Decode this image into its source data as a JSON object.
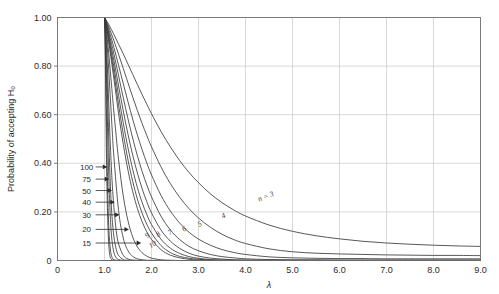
{
  "chart_data": {
    "type": "line",
    "title": "",
    "xlabel": "λ",
    "ylabel": "Probability of accepting H₀",
    "xlim": [
      0,
      9.0
    ],
    "ylim": [
      0,
      1.0
    ],
    "grid": true,
    "legend_position": "inline-curve-labels",
    "xticks": [
      "0",
      "1.0",
      "2.0",
      "3.0",
      "4.0",
      "5.0",
      "6.0",
      "7.0",
      "8.0",
      "9.0"
    ],
    "xtick_values": [
      0,
      1,
      2,
      3,
      4,
      5,
      6,
      7,
      8,
      9
    ],
    "yticks": [
      "0",
      "0.20",
      "0.40",
      "0.60",
      "0.80",
      "1.00"
    ],
    "ytick_values": [
      0,
      0.2,
      0.4,
      0.6,
      0.8,
      1.0
    ],
    "series": [
      {
        "name": "n = 3",
        "n": 3,
        "label": "n = 3",
        "label_x": 4.45,
        "label_y": 0.255,
        "label_rot": -22,
        "x": [
          1.0,
          1.05,
          1.1,
          1.2,
          1.3,
          1.4,
          1.5,
          1.6,
          1.7,
          1.8,
          1.9,
          2.0,
          2.2,
          2.4,
          2.6,
          2.8,
          3.0,
          3.25,
          3.5,
          3.75,
          4.0,
          4.5,
          5.0,
          5.5,
          6.0,
          6.5,
          7.0,
          7.5,
          8.0,
          8.5,
          9.0
        ],
        "y": [
          1.0,
          0.985,
          0.968,
          0.93,
          0.89,
          0.85,
          0.808,
          0.766,
          0.724,
          0.683,
          0.643,
          0.604,
          0.532,
          0.468,
          0.411,
          0.362,
          0.32,
          0.275,
          0.238,
          0.208,
          0.183,
          0.146,
          0.12,
          0.102,
          0.089,
          0.079,
          0.072,
          0.067,
          0.063,
          0.06,
          0.058
        ]
      },
      {
        "name": "4",
        "n": 4,
        "label": "4",
        "label_x": 3.55,
        "label_y": 0.175,
        "label_rot": -26,
        "x": [
          1.0,
          1.05,
          1.1,
          1.2,
          1.3,
          1.4,
          1.5,
          1.6,
          1.7,
          1.8,
          1.9,
          2.0,
          2.2,
          2.4,
          2.6,
          2.8,
          3.0,
          3.25,
          3.5,
          3.75,
          4.0,
          4.5,
          5.0,
          5.5,
          6.0,
          6.5,
          7.0,
          7.5,
          8.0,
          8.5,
          9.0
        ],
        "y": [
          1.0,
          0.98,
          0.957,
          0.905,
          0.848,
          0.79,
          0.731,
          0.673,
          0.617,
          0.564,
          0.514,
          0.468,
          0.386,
          0.317,
          0.26,
          0.213,
          0.175,
          0.137,
          0.108,
          0.086,
          0.07,
          0.048,
          0.036,
          0.03,
          0.027,
          0.025,
          0.023,
          0.022,
          0.021,
          0.021,
          0.02
        ]
      },
      {
        "name": "5",
        "n": 5,
        "label": "5",
        "label_x": 3.05,
        "label_y": 0.142,
        "label_rot": -30,
        "x": [
          1.0,
          1.05,
          1.1,
          1.2,
          1.3,
          1.4,
          1.5,
          1.6,
          1.7,
          1.8,
          1.9,
          2.0,
          2.2,
          2.4,
          2.6,
          2.8,
          3.0,
          3.25,
          3.5,
          3.75,
          4.0,
          4.5,
          5.0,
          5.5,
          6.0,
          6.5,
          7.0,
          8.0,
          9.0
        ],
        "y": [
          1.0,
          0.975,
          0.945,
          0.877,
          0.803,
          0.727,
          0.653,
          0.582,
          0.516,
          0.456,
          0.401,
          0.352,
          0.269,
          0.204,
          0.154,
          0.116,
          0.088,
          0.063,
          0.045,
          0.033,
          0.025,
          0.015,
          0.011,
          0.009,
          0.008,
          0.008,
          0.007,
          0.007,
          0.007
        ]
      },
      {
        "name": "6",
        "n": 6,
        "label": "6",
        "label_x": 2.72,
        "label_y": 0.122,
        "label_rot": -32,
        "x": [
          1.0,
          1.05,
          1.1,
          1.2,
          1.3,
          1.4,
          1.5,
          1.6,
          1.7,
          1.8,
          1.9,
          2.0,
          2.2,
          2.4,
          2.6,
          2.8,
          3.0,
          3.25,
          3.5,
          3.75,
          4.0,
          4.5,
          5.0,
          5.5,
          6.0,
          7.0,
          9.0
        ],
        "y": [
          1.0,
          0.97,
          0.932,
          0.85,
          0.76,
          0.669,
          0.583,
          0.503,
          0.431,
          0.367,
          0.311,
          0.262,
          0.183,
          0.126,
          0.086,
          0.058,
          0.04,
          0.025,
          0.016,
          0.011,
          0.007,
          0.004,
          0.003,
          0.003,
          0.002,
          0.002,
          0.002
        ]
      },
      {
        "name": "7",
        "n": 7,
        "label": "7",
        "label_x": 2.42,
        "label_y": 0.108,
        "label_rot": -34,
        "x": [
          1.0,
          1.05,
          1.1,
          1.2,
          1.3,
          1.4,
          1.5,
          1.6,
          1.7,
          1.8,
          1.9,
          2.0,
          2.2,
          2.4,
          2.6,
          2.8,
          3.0,
          3.25,
          3.5,
          3.75,
          4.0,
          4.5,
          5.0,
          6.0,
          9.0
        ],
        "y": [
          1.0,
          0.965,
          0.92,
          0.823,
          0.718,
          0.615,
          0.519,
          0.434,
          0.36,
          0.296,
          0.242,
          0.196,
          0.126,
          0.08,
          0.05,
          0.03,
          0.018,
          0.01,
          0.006,
          0.003,
          0.002,
          0.001,
          0.001,
          0.001,
          0.001
        ]
      },
      {
        "name": "8",
        "n": 8,
        "label": "8",
        "label_x": 2.17,
        "label_y": 0.1,
        "label_rot": -36,
        "x": [
          1.0,
          1.05,
          1.1,
          1.2,
          1.3,
          1.4,
          1.5,
          1.6,
          1.7,
          1.8,
          1.9,
          2.0,
          2.2,
          2.4,
          2.6,
          2.8,
          3.0,
          3.25,
          3.5,
          4.0,
          5.0,
          9.0
        ],
        "y": [
          1.0,
          0.96,
          0.908,
          0.797,
          0.678,
          0.565,
          0.463,
          0.375,
          0.3,
          0.239,
          0.189,
          0.148,
          0.088,
          0.051,
          0.029,
          0.016,
          0.009,
          0.004,
          0.002,
          0.001,
          0.0,
          0.0
        ]
      },
      {
        "name": "9",
        "n": 9,
        "label": "9",
        "label_x": 1.94,
        "label_y": 0.095,
        "label_rot": -38,
        "x": [
          1.0,
          1.05,
          1.1,
          1.2,
          1.3,
          1.4,
          1.5,
          1.6,
          1.7,
          1.8,
          1.9,
          2.0,
          2.2,
          2.4,
          2.6,
          2.8,
          3.0,
          3.25,
          3.5,
          4.0,
          5.0,
          9.0
        ],
        "y": [
          1.0,
          0.956,
          0.896,
          0.772,
          0.64,
          0.52,
          0.414,
          0.326,
          0.253,
          0.195,
          0.149,
          0.113,
          0.062,
          0.033,
          0.017,
          0.009,
          0.005,
          0.002,
          0.001,
          0.0,
          0.0,
          0.0
        ]
      },
      {
        "name": "10",
        "n": 10,
        "label": "10",
        "label_x": 2.05,
        "label_y": 0.058,
        "label_rot": -34,
        "x": [
          1.0,
          1.05,
          1.1,
          1.2,
          1.3,
          1.4,
          1.5,
          1.6,
          1.7,
          1.8,
          1.9,
          2.0,
          2.2,
          2.4,
          2.6,
          2.8,
          3.0,
          3.25,
          3.5,
          4.0,
          5.0,
          9.0
        ],
        "y": [
          1.0,
          0.951,
          0.885,
          0.748,
          0.604,
          0.478,
          0.371,
          0.284,
          0.214,
          0.16,
          0.118,
          0.087,
          0.045,
          0.022,
          0.011,
          0.005,
          0.002,
          0.001,
          0.0,
          0.0,
          0.0,
          0.0
        ]
      },
      {
        "name": "15",
        "n": 15,
        "label": "",
        "label_x": null,
        "label_y": null,
        "label_rot": 0,
        "x": [
          1.0,
          1.05,
          1.1,
          1.15,
          1.2,
          1.3,
          1.4,
          1.5,
          1.6,
          1.7,
          1.8,
          1.9,
          2.0,
          2.2,
          2.4,
          2.6,
          2.8,
          3.0,
          3.5,
          4.0,
          9.0
        ],
        "y": [
          1.0,
          0.931,
          0.831,
          0.721,
          0.611,
          0.414,
          0.265,
          0.163,
          0.097,
          0.056,
          0.032,
          0.018,
          0.01,
          0.003,
          0.001,
          0.0,
          0.0,
          0.0,
          0.0,
          0.0,
          0.0
        ]
      },
      {
        "name": "20",
        "n": 20,
        "label": "",
        "label_x": null,
        "label_y": null,
        "label_rot": 0,
        "x": [
          1.0,
          1.04,
          1.08,
          1.12,
          1.16,
          1.2,
          1.3,
          1.4,
          1.5,
          1.6,
          1.7,
          1.8,
          1.9,
          2.0,
          2.2,
          2.4,
          2.6,
          3.0,
          9.0
        ],
        "y": [
          1.0,
          0.93,
          0.817,
          0.684,
          0.549,
          0.426,
          0.205,
          0.092,
          0.04,
          0.017,
          0.007,
          0.003,
          0.001,
          0.001,
          0.0,
          0.0,
          0.0,
          0.0,
          0.0
        ]
      },
      {
        "name": "30",
        "n": 30,
        "label": "",
        "label_x": null,
        "label_y": null,
        "label_rot": 0,
        "x": [
          1.0,
          1.03,
          1.06,
          1.09,
          1.12,
          1.16,
          1.2,
          1.25,
          1.3,
          1.4,
          1.5,
          1.6,
          1.7,
          1.8,
          2.0,
          2.4,
          9.0
        ],
        "y": [
          1.0,
          0.928,
          0.801,
          0.648,
          0.495,
          0.331,
          0.218,
          0.122,
          0.068,
          0.021,
          0.006,
          0.002,
          0.001,
          0.0,
          0.0,
          0.0,
          0.0
        ]
      },
      {
        "name": "40",
        "n": 40,
        "label": "",
        "label_x": null,
        "label_y": null,
        "label_rot": 0,
        "x": [
          1.0,
          1.025,
          1.05,
          1.075,
          1.1,
          1.13,
          1.16,
          1.2,
          1.25,
          1.3,
          1.4,
          1.5,
          1.6,
          1.8,
          9.0
        ],
        "y": [
          1.0,
          0.92,
          0.776,
          0.607,
          0.445,
          0.287,
          0.18,
          0.098,
          0.046,
          0.021,
          0.004,
          0.001,
          0.0,
          0.0,
          0.0
        ]
      },
      {
        "name": "50",
        "n": 50,
        "label": "",
        "label_x": null,
        "label_y": null,
        "label_rot": 0,
        "x": [
          1.0,
          1.02,
          1.04,
          1.06,
          1.08,
          1.1,
          1.13,
          1.16,
          1.2,
          1.25,
          1.3,
          1.4,
          1.5,
          1.7,
          9.0
        ],
        "y": [
          1.0,
          0.919,
          0.768,
          0.591,
          0.425,
          0.29,
          0.155,
          0.081,
          0.033,
          0.011,
          0.004,
          0.0,
          0.0,
          0.0,
          0.0
        ]
      },
      {
        "name": "75",
        "n": 75,
        "label": "",
        "label_x": null,
        "label_y": null,
        "label_rot": 0,
        "x": [
          1.0,
          1.015,
          1.03,
          1.045,
          1.06,
          1.08,
          1.1,
          1.13,
          1.16,
          1.2,
          1.25,
          1.3,
          1.4,
          1.6,
          9.0
        ],
        "y": [
          1.0,
          0.91,
          0.74,
          0.542,
          0.367,
          0.2,
          0.103,
          0.038,
          0.013,
          0.003,
          0.001,
          0.0,
          0.0,
          0.0,
          0.0
        ]
      },
      {
        "name": "100",
        "n": 100,
        "label": "",
        "label_x": null,
        "label_y": null,
        "label_rot": 0,
        "x": [
          1.0,
          1.012,
          1.024,
          1.036,
          1.05,
          1.065,
          1.08,
          1.1,
          1.12,
          1.15,
          1.2,
          1.25,
          1.35,
          1.5,
          9.0
        ],
        "y": [
          1.0,
          0.903,
          0.724,
          0.514,
          0.325,
          0.19,
          0.107,
          0.042,
          0.016,
          0.004,
          0.001,
          0.0,
          0.0,
          0.0,
          0.0
        ]
      }
    ],
    "annotations": [
      {
        "label": "100",
        "text_x": 0.62,
        "y": 0.385,
        "arrow_x": 1.06
      },
      {
        "label": "75",
        "text_x": 0.62,
        "y": 0.335,
        "arrow_x": 1.1
      },
      {
        "label": "50",
        "text_x": 0.62,
        "y": 0.288,
        "arrow_x": 1.16
      },
      {
        "label": "40",
        "text_x": 0.62,
        "y": 0.24,
        "arrow_x": 1.22
      },
      {
        "label": "30",
        "text_x": 0.62,
        "y": 0.188,
        "arrow_x": 1.32
      },
      {
        "label": "20",
        "text_x": 0.62,
        "y": 0.128,
        "arrow_x": 1.52
      },
      {
        "label": "15",
        "text_x": 0.62,
        "y": 0.072,
        "arrow_x": 1.78
      }
    ]
  },
  "colors": {
    "curve": "#3a3a3a",
    "grid": "#c9c9c9",
    "frame": "#6e6e6e",
    "text": "#2b2b2b",
    "background": "#ffffff"
  }
}
